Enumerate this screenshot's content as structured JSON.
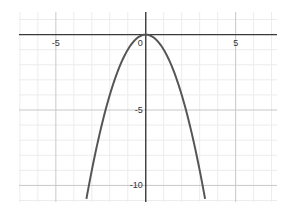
{
  "chart_data": {
    "type": "line",
    "title": "",
    "xlabel": "",
    "ylabel": "",
    "function": "y = -x^2",
    "series": [
      {
        "name": "y = -x^2",
        "color": "#555555",
        "x": [
          -3.3,
          -3,
          -2.5,
          -2,
          -1.5,
          -1,
          -0.5,
          0,
          0.5,
          1,
          1.5,
          2,
          2.5,
          3,
          3.3
        ],
        "y": [
          -10.89,
          -9,
          -6.25,
          -4,
          -2.25,
          -1,
          -0.25,
          0,
          -0.25,
          -1,
          -2.25,
          -4,
          -6.25,
          -9,
          -10.89
        ]
      }
    ],
    "xlim": [
      -7.05,
      7.3
    ],
    "ylim": [
      -11.1,
      1.5
    ],
    "x_ticks": [
      -5,
      5
    ],
    "x_tick_labels": [
      "-5",
      "5"
    ],
    "y_ticks": [
      -5,
      -10
    ],
    "y_tick_labels": [
      "-5",
      "-10"
    ],
    "origin_label": "0",
    "grid": true,
    "major_grid_step": 5,
    "minor_grid_step": 1
  }
}
